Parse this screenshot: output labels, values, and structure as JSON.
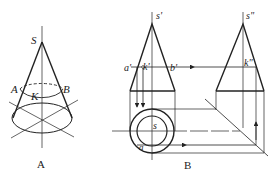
{
  "figure_a": {
    "caption": "A",
    "labels": {
      "apex": "S",
      "left_point": "A",
      "right_point": "B",
      "point": "K"
    }
  },
  "figure_b": {
    "caption": "B",
    "labels": {
      "front_apex": "s'",
      "front_a": "a'",
      "front_k": "k'",
      "front_b": "b'",
      "side_apex": "s\"",
      "side_k": "k\"",
      "top_apex": "s",
      "top_a": "a"
    }
  },
  "colors": {
    "line": "#222222",
    "background": "#ffffff"
  }
}
